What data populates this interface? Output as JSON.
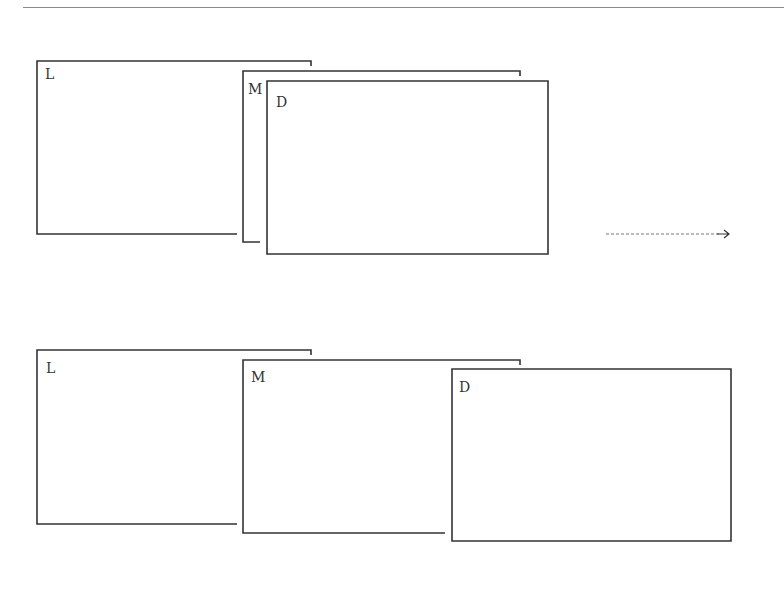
{
  "diagram": {
    "stroke_color": "#333333",
    "arrow_color": "#777777",
    "top_row": {
      "state": "stacked",
      "panels": [
        {
          "id": "L",
          "label": "L",
          "x": 37,
          "y": 61,
          "right": 311,
          "bottom": 234,
          "bottom_end": 237
        },
        {
          "id": "M",
          "label": "M",
          "x": 243,
          "y": 71,
          "right": 520,
          "bottom": 242,
          "bottom_end": 260
        },
        {
          "id": "D",
          "label": "D",
          "x": 267,
          "y": 81,
          "right": 548,
          "bottom": 254
        }
      ]
    },
    "bottom_row": {
      "state": "spread",
      "panels": [
        {
          "id": "L",
          "label": "L",
          "x": 37,
          "y": 350,
          "right": 311,
          "bottom": 524,
          "bottom_end": 237
        },
        {
          "id": "M",
          "label": "M",
          "x": 243,
          "y": 360,
          "right": 520,
          "bottom": 533,
          "bottom_end": 445
        },
        {
          "id": "D",
          "label": "D",
          "x": 452,
          "y": 369,
          "right": 731,
          "bottom": 541
        }
      ]
    },
    "arrow": {
      "x1": 606,
      "x2": 729,
      "y": 234,
      "style": "dashed",
      "direction": "right"
    }
  }
}
